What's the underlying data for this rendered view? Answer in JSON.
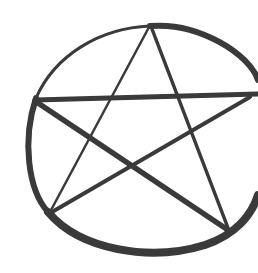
{
  "image": {
    "subject": "hand-drawn pentagram inside a circle",
    "stroke_color": "#3a3a3a",
    "background_color": "#ffffff"
  }
}
